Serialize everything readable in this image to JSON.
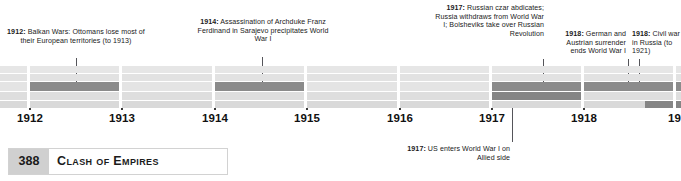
{
  "document": {
    "page_number": "388",
    "chapter_title": "Clash of Empires"
  },
  "timeline": {
    "years": [
      "1912",
      "1913",
      "1914",
      "1915",
      "1916",
      "1917",
      "1918",
      "19"
    ],
    "axis_start_year": 1912,
    "axis_end_year": 1919
  },
  "callouts": [
    {
      "id": "balkan-wars",
      "year": "1912",
      "text": "1912: Balkan Wars: Ottomans lose most of their European territories (to 1913)",
      "label_bold": "1912:",
      "label_rest": " Balkan Wars: Ottomans lose most of their European territories (to 1913)",
      "position": "above",
      "align": "center"
    },
    {
      "id": "sarajevo",
      "year": "1914",
      "text": "1914: Assassination of Archduke Franz Ferdinand in Sarajevo precipitates World War I",
      "label_bold": "1914:",
      "label_rest": " Assassination of Archduke Franz Ferdinand in Sarajevo precipitates World War I",
      "position": "above",
      "align": "center"
    },
    {
      "id": "russian-revolution",
      "year": "1917",
      "text": "1917: Russian czar abdicates; Russia withdraws from World War I; Bolsheviks take over Russian Revolution",
      "label_bold": "1917:",
      "label_rest": " Russian czar abdicates; Russia withdraws from World War I; Bolsheviks take over Russian Revolution",
      "position": "above",
      "align": "right"
    },
    {
      "id": "german-austrian-surrender",
      "year": "1918",
      "text": "1918: German and Austrian surrender ends World War I",
      "label_bold": "1918:",
      "label_rest": " German and Austrian surrender ends World War I",
      "position": "above",
      "align": "right"
    },
    {
      "id": "russian-civil-war",
      "year": "1918",
      "text": "1918: Civil war in Russia (to 1921)",
      "label_bold": "1918:",
      "label_rest": " Civil war in Russia (to 1921)",
      "position": "above",
      "align": "left"
    },
    {
      "id": "us-enters-wwi",
      "year": "1917",
      "text": "1917: US enters World War I on Allied side",
      "label_bold": "1917:",
      "label_rest": " US enters World War I on Allied side",
      "position": "below",
      "align": "right"
    }
  ],
  "event_bars": [
    {
      "id": "balkan-wars-bar",
      "lane": 3,
      "start_year": "1912",
      "end_year": "1913"
    },
    {
      "id": "world-war-one-bar",
      "lane": 3,
      "start_year": "1914",
      "end_year": "1915"
    },
    {
      "id": "russia-bar-upper",
      "lane": 3,
      "start_year": "1917",
      "end_year": "1918"
    },
    {
      "id": "russia-bar-lower",
      "lane": 4,
      "start_year": "1917",
      "end_year": "1918"
    },
    {
      "id": "civil-war-bar",
      "lane": 3,
      "start_year": "1918",
      "end_year": "19"
    },
    {
      "id": "civil-war-bar-lower",
      "lane": 5,
      "start_year": "1918",
      "end_year": "19"
    }
  ],
  "colors": {
    "band_light": "#e4e4e4",
    "band_dark": "#8b8b8b",
    "leader_line": "#55555a",
    "page_num_bg": "#d0d0d0",
    "text": "#1a1a1a"
  }
}
